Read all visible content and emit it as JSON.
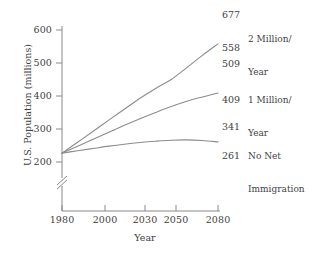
{
  "chart_data": {
    "type": "line",
    "title": "",
    "xlabel": "Year",
    "ylabel": "U.S. Population (millions)",
    "xlim": [
      1980,
      2080
    ],
    "ylim": [
      190,
      620
    ],
    "grid": false,
    "legend_position": "right-inline",
    "y_axis_break": true,
    "x_ticks": [
      1980,
      2000,
      2030,
      2050,
      2080
    ],
    "x_tick_labels": [
      "1980",
      "2000",
      "2030",
      "2050",
      "2080"
    ],
    "y_ticks": [
      200,
      300,
      400,
      500,
      600
    ],
    "y_tick_labels": [
      "200",
      "300",
      "400",
      "500",
      "600"
    ],
    "series": [
      {
        "name": "2 Million/ Year",
        "label_lines": [
          "2 Million/",
          "Year"
        ],
        "end_value": 558,
        "end_value_label": "558",
        "secondary_value_label": "677",
        "x": [
          1980,
          1990,
          2000,
          2010,
          2020,
          2030,
          2040,
          2050,
          2060,
          2070,
          2080
        ],
        "values": [
          227,
          260,
          293,
          327,
          360,
          393,
          423,
          450,
          486,
          523,
          558
        ]
      },
      {
        "name": "1 Million/ Year",
        "label_lines": [
          "1 Million/",
          "Year"
        ],
        "end_value": 409,
        "end_value_label": "409",
        "secondary_value_label": "509",
        "x": [
          1980,
          1990,
          2000,
          2010,
          2020,
          2030,
          2040,
          2050,
          2060,
          2070,
          2080
        ],
        "values": [
          227,
          248,
          269,
          290,
          311,
          331,
          350,
          368,
          384,
          397,
          409
        ]
      },
      {
        "name": "No Net Immigration",
        "label_lines": [
          "No Net",
          "Immigration"
        ],
        "end_value": 261,
        "end_value_label": "261",
        "secondary_value_label": "341",
        "x": [
          1980,
          1990,
          2000,
          2010,
          2020,
          2030,
          2040,
          2050,
          2060,
          2070,
          2080
        ],
        "values": [
          227,
          234,
          241,
          248,
          254,
          259,
          263,
          266,
          267,
          265,
          261
        ]
      }
    ],
    "value_labels_right": [
      "677",
      "558",
      "509",
      "409",
      "341",
      "261"
    ],
    "colors": {
      "line": "#8c8c8c",
      "axis": "#8a8a8a",
      "text": "#3f3f3f",
      "background": "#ffffff"
    }
  },
  "axes": {
    "x_title": "Year",
    "y_title": "U.S. Population (millions)"
  },
  "annotations": {
    "top": {
      "value": "677",
      "line1": "2 Million/",
      "line2": "Year"
    },
    "middle": {
      "value": "509",
      "line1": "1 Million/",
      "line2": "Year"
    },
    "bottom": {
      "value": "341",
      "line1": "No Net",
      "line2": "Immigration"
    }
  },
  "end_labels": {
    "top_curve": "558",
    "middle_curve": "409",
    "bottom_curve": "261"
  },
  "ticks": {
    "y": [
      "600",
      "500",
      "400",
      "300",
      "200"
    ],
    "x": [
      "1980",
      "2000",
      "2030",
      "2050",
      "2080"
    ]
  }
}
